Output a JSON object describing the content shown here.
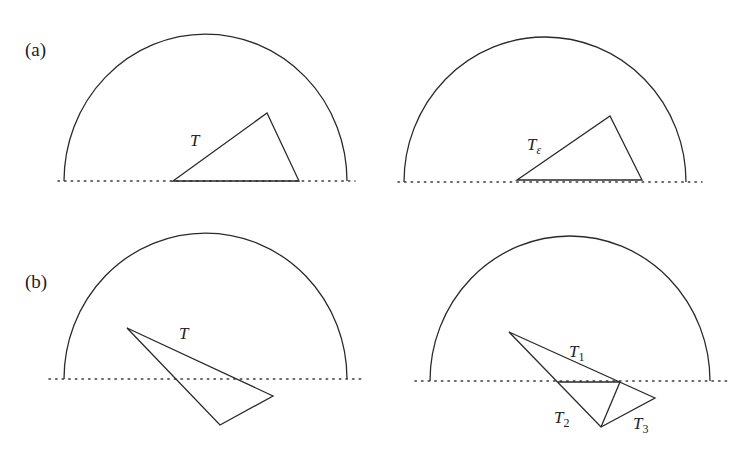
{
  "figure": {
    "rows": [
      {
        "label": "(a)",
        "panels": [
          {
            "name": "a-left",
            "semicircle": {
              "x_left": 64,
              "x_right": 347,
              "baseline_y": 181,
              "top_y": 34
            },
            "baseline": {
              "x1": 58,
              "x2": 355,
              "y": 181
            },
            "triangles": [
              {
                "name": "T",
                "points": [
                  [
                    173,
                    181
                  ],
                  [
                    267,
                    113
                  ],
                  [
                    299,
                    181
                  ]
                ]
              }
            ],
            "labels": [
              {
                "text": "T",
                "sub": "",
                "x": 190,
                "y": 146
              }
            ]
          },
          {
            "name": "a-right",
            "semicircle": {
              "x_left": 404,
              "x_right": 686,
              "baseline_y": 182,
              "top_y": 37
            },
            "baseline": {
              "x1": 398,
              "x2": 702,
              "y": 182
            },
            "triangles": [
              {
                "name": "T_epsilon",
                "points": [
                  [
                    517,
                    180
                  ],
                  [
                    610,
                    116
                  ],
                  [
                    642,
                    180
                  ]
                ]
              }
            ],
            "labels": [
              {
                "text": "T",
                "sub": "ε",
                "x": 527,
                "y": 150
              }
            ]
          }
        ]
      },
      {
        "label": "(b)",
        "panels": [
          {
            "name": "b-left",
            "semicircle": {
              "x_left": 64,
              "x_right": 347,
              "baseline_y": 379,
              "top_y": 233
            },
            "baseline": {
              "x1": 49,
              "x2": 362,
              "y": 379
            },
            "triangles": [
              {
                "name": "T",
                "points": [
                  [
                    127,
                    328
                  ],
                  [
                    273,
                    396
                  ],
                  [
                    220,
                    425
                  ]
                ]
              }
            ],
            "labels": [
              {
                "text": "T",
                "sub": "",
                "x": 179,
                "y": 339
              }
            ]
          },
          {
            "name": "b-right",
            "semicircle": {
              "x_left": 430,
              "x_right": 710,
              "baseline_y": 381,
              "top_y": 236
            },
            "baseline": {
              "x1": 415,
              "x2": 728,
              "y": 381
            },
            "triangles": [
              {
                "name": "T",
                "points": [
                  [
                    509,
                    332
                  ],
                  [
                    655,
                    398
                  ],
                  [
                    601,
                    427
                  ]
                ]
              }
            ],
            "segments": [
              {
                "name": "cut-baseline",
                "x1": 558,
                "y1": 382,
                "x2": 620,
                "y2": 382
              },
              {
                "name": "cut-diagonal",
                "x1": 620,
                "y1": 382,
                "x2": 601,
                "y2": 427
              }
            ],
            "labels": [
              {
                "text": "T",
                "sub": "1",
                "x": 569,
                "y": 357
              },
              {
                "text": "T",
                "sub": "2",
                "x": 554,
                "y": 423
              },
              {
                "text": "T",
                "sub": "3",
                "x": 633,
                "y": 429
              }
            ]
          }
        ]
      }
    ]
  }
}
